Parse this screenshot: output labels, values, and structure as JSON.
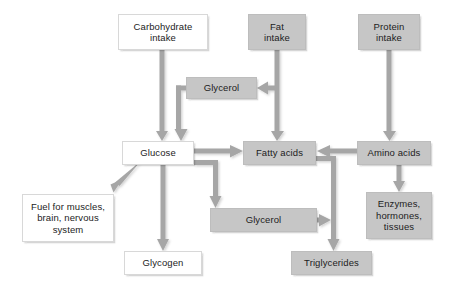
{
  "diagram": {
    "colors": {
      "gray_fill": "#c6c6c6",
      "white_fill": "#ffffff",
      "arrow": "#a6a6a6",
      "text": "#1c1c1c",
      "background": "#ffffff"
    },
    "nodes": [
      {
        "id": "carbohydrate_intake",
        "label": "Carbohydrate\nintake",
        "style": "white",
        "x": 118,
        "y": 14,
        "w": 90,
        "h": 36
      },
      {
        "id": "fat_intake",
        "label": "Fat\nintake",
        "style": "gray",
        "x": 248,
        "y": 14,
        "w": 58,
        "h": 36
      },
      {
        "id": "protein_intake",
        "label": "Protein\nintake",
        "style": "gray",
        "x": 358,
        "y": 14,
        "w": 62,
        "h": 36
      },
      {
        "id": "glycerol_top",
        "label": "Glycerol",
        "style": "gray",
        "x": 186,
        "y": 77,
        "w": 71,
        "h": 22
      },
      {
        "id": "glucose",
        "label": "Glucose",
        "style": "white",
        "x": 122,
        "y": 141,
        "w": 72,
        "h": 24
      },
      {
        "id": "fatty_acids",
        "label": "Fatty acids",
        "style": "gray",
        "x": 243,
        "y": 141,
        "w": 73,
        "h": 24
      },
      {
        "id": "amino_acids",
        "label": "Amino acids",
        "style": "gray",
        "x": 357,
        "y": 141,
        "w": 74,
        "h": 24
      },
      {
        "id": "fuel",
        "label": "Fuel for muscles,\nbrain, nervous\nsystem",
        "style": "white",
        "x": 22,
        "y": 194,
        "w": 92,
        "h": 48
      },
      {
        "id": "glycerol_bottom",
        "label": "Glycerol",
        "style": "gray",
        "x": 210,
        "y": 208,
        "w": 107,
        "h": 24
      },
      {
        "id": "enzymes",
        "label": "Enzymes,\nhormones,\ntissues",
        "style": "gray",
        "x": 366,
        "y": 192,
        "w": 66,
        "h": 47
      },
      {
        "id": "glycogen",
        "label": "Glycogen",
        "style": "white",
        "x": 124,
        "y": 251,
        "w": 78,
        "h": 24
      },
      {
        "id": "triglycerides",
        "label": "Triglycerides",
        "style": "gray",
        "x": 291,
        "y": 251,
        "w": 81,
        "h": 24
      }
    ],
    "edges": [
      {
        "id": "carb-to-glucose",
        "from": "carbohydrate_intake",
        "to": "glucose",
        "shape": "straight-down"
      },
      {
        "id": "fat-to-fattyacids",
        "from": "fat_intake",
        "to": "fatty_acids",
        "shape": "straight-down"
      },
      {
        "id": "protein-to-aminoacids",
        "from": "protein_intake",
        "to": "amino_acids",
        "shape": "straight-down"
      },
      {
        "id": "fat-to-glycerol-top",
        "from": "fat_intake",
        "to": "glycerol_top",
        "shape": "branch-left"
      },
      {
        "id": "glycerol-top-to-glucose",
        "from": "glycerol_top",
        "to": "glucose",
        "shape": "left-then-down"
      },
      {
        "id": "glucose-to-fattyacids",
        "from": "glucose",
        "to": "fatty_acids",
        "shape": "straight-right"
      },
      {
        "id": "glucose-to-fuel",
        "from": "glucose",
        "to": "fuel",
        "shape": "diagonal-down-left"
      },
      {
        "id": "glucose-to-glycogen",
        "from": "glucose",
        "to": "glycogen",
        "shape": "straight-down"
      },
      {
        "id": "glucose-to-glycerol-bottom",
        "from": "glucose",
        "to": "glycerol_bottom",
        "shape": "right-then-down"
      },
      {
        "id": "aminoacids-to-fattyacids",
        "from": "amino_acids",
        "to": "fatty_acids",
        "shape": "straight-left"
      },
      {
        "id": "aminoacids-to-enzymes",
        "from": "amino_acids",
        "to": "enzymes",
        "shape": "straight-down"
      },
      {
        "id": "fattyacids-to-triglycerides",
        "from": "fatty_acids",
        "to": "triglycerides",
        "shape": "right-then-down"
      },
      {
        "id": "glycerol-bottom-to-triglycerides",
        "from": "glycerol_bottom",
        "to": "triglycerides",
        "shape": "straight-right"
      }
    ]
  }
}
